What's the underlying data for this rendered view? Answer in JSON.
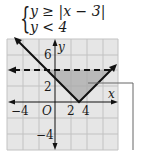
{
  "system": {
    "line1": "y ≥ |x − 3|",
    "line2": "y < 4"
  },
  "graph": {
    "grid_color": "#c8c8c8",
    "background_color": "#e6e6e6",
    "shade_color": "#a9a9a9",
    "line_color": "#111111",
    "x_axis_label": "x",
    "y_axis_label": "y",
    "origin_label": "O",
    "x_tick_labels": [
      "−4",
      "2",
      "4"
    ],
    "y_tick_labels": [
      "6",
      "2",
      "−4"
    ],
    "grid_step": 2,
    "x_range": [
      -6,
      8
    ],
    "y_range": [
      -6,
      8
    ],
    "boundaries": [
      {
        "equation": "y = |x − 3|",
        "style": "solid",
        "vertex": [
          3,
          0
        ]
      },
      {
        "equation": "y = 4",
        "style": "dashed"
      }
    ],
    "shaded_region": "triangle with vertices (−1, 4), (3, 0), (7, 4)"
  }
}
